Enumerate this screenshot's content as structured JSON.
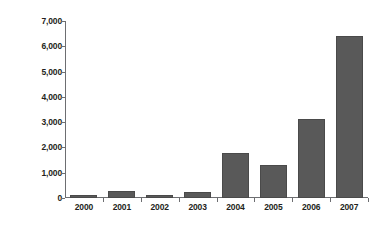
{
  "chart_data": {
    "type": "bar",
    "title": "",
    "subtitle": "",
    "xlabel": "",
    "ylabel": "Kilograms seized",
    "categories": [
      "2000",
      "2001",
      "2002",
      "2003",
      "2004",
      "2005",
      "2006",
      "2007"
    ],
    "values": [
      100,
      270,
      100,
      220,
      1780,
      1320,
      3120,
      6400
    ],
    "series": [
      {
        "name": "Kilograms seized",
        "values": [
          100,
          270,
          100,
          220,
          1780,
          1320,
          3120,
          6400
        ]
      }
    ],
    "ylim": [
      0,
      7000
    ],
    "ytick_values": [
      0,
      1000,
      2000,
      3000,
      4000,
      5000,
      6000,
      7000
    ],
    "ytick_labels": [
      "0",
      "1,000",
      "2,000",
      "3,000",
      "4,000",
      "5,000",
      "6,000",
      "7,000"
    ],
    "grid": false,
    "legend": false,
    "legend_position": "none",
    "bar_color": "#595959",
    "bar_outline_color": "#4a4a4a",
    "axis_color": "#6d6e71",
    "text_color": "#231f20",
    "background_color": "#ffffff"
  }
}
